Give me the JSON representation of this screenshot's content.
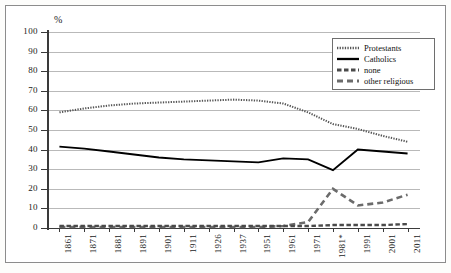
{
  "axis": {
    "y_unit_label": "%",
    "y_ticks": [
      100,
      90,
      80,
      70,
      60,
      50,
      40,
      30,
      20,
      10,
      0
    ],
    "y_min": 0,
    "y_max": 100
  },
  "legend": {
    "items": [
      {
        "label": "Protestants",
        "style": "dotted",
        "color": "#4d4d4d"
      },
      {
        "label": "Catholics",
        "style": "solid",
        "color": "#000000"
      },
      {
        "label": "none",
        "style": "dash-short",
        "color": "#6b6b6b"
      },
      {
        "label": "other religious",
        "style": "dash-long",
        "color": "#5a5a5a"
      }
    ]
  },
  "chart_data": {
    "type": "line",
    "title": "",
    "subtitle": "",
    "xlabel": "",
    "ylabel": "%",
    "ylim": [
      0,
      100
    ],
    "grid": true,
    "legend_position": "top-right",
    "categories": [
      "1861",
      "1871",
      "1881",
      "1891",
      "1901",
      "1911",
      "1926",
      "1937",
      "1951",
      "1961",
      "1971",
      "1981*",
      "1991",
      "2001",
      "2011"
    ],
    "series": [
      {
        "name": "Protestants",
        "style": "dotted",
        "values": [
          59,
          61,
          62.5,
          63.5,
          64,
          64.5,
          65,
          65.5,
          65,
          63.5,
          59,
          53,
          50.5,
          47,
          44
        ]
      },
      {
        "name": "Catholics",
        "style": "solid",
        "values": [
          41.5,
          40.5,
          39,
          37.5,
          36,
          35,
          34.5,
          34,
          33.5,
          35.5,
          35,
          29.5,
          40,
          39,
          38
        ]
      },
      {
        "name": "none",
        "style": "dash-long",
        "values": [
          0.5,
          0.5,
          0.5,
          0.5,
          0.5,
          0.5,
          0.5,
          0.5,
          0.5,
          1,
          3,
          20,
          11.5,
          13,
          17
        ]
      },
      {
        "name": "other religious",
        "style": "dash-short",
        "values": [
          1,
          1,
          1,
          1,
          1,
          1,
          1,
          1,
          1,
          1,
          1,
          1.5,
          1.5,
          1.5,
          2
        ]
      }
    ]
  }
}
